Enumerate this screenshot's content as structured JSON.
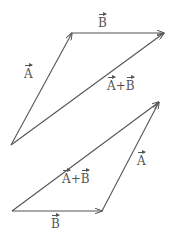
{
  "diagram": {
    "colors": {
      "line": "#555555",
      "background": "#ffffff"
    },
    "top_figure": {
      "vectors": [
        {
          "name": "A",
          "label": "A",
          "from": [
            11,
            145
          ],
          "to": [
            72,
            33
          ]
        },
        {
          "name": "B",
          "label": "B",
          "from": [
            72,
            33
          ],
          "to": [
            164,
            33
          ]
        },
        {
          "name": "A+B",
          "label": "A+B",
          "from": [
            11,
            145
          ],
          "to": [
            164,
            33
          ]
        }
      ],
      "labels": {
        "a": "A",
        "b": "B",
        "sum_a": "A",
        "sum_plus": "+",
        "sum_b": "B"
      }
    },
    "bottom_figure": {
      "vectors": [
        {
          "name": "B",
          "label": "B",
          "from": [
            12,
            211
          ],
          "to": [
            102,
            211
          ]
        },
        {
          "name": "A",
          "label": "A",
          "from": [
            102,
            211
          ],
          "to": [
            159,
            102
          ]
        },
        {
          "name": "A+B",
          "label": "A+B",
          "from": [
            12,
            211
          ],
          "to": [
            159,
            102
          ]
        }
      ],
      "labels": {
        "a": "A",
        "b": "B",
        "sum_a": "A",
        "sum_plus": "+",
        "sum_b": "B"
      }
    }
  }
}
